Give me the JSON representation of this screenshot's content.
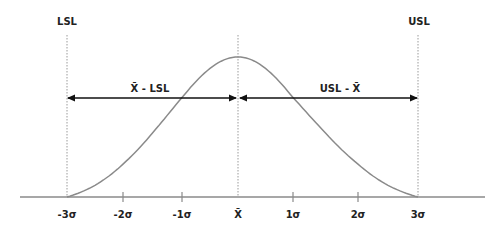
{
  "diagram": {
    "limits": {
      "lower": {
        "label": "LSL",
        "sigma": -3
      },
      "upper": {
        "label": "USL",
        "sigma": 3
      },
      "mean": {
        "label": "X̄",
        "sigma": 0
      }
    },
    "spans": {
      "left": {
        "label": "X̄ - LSL",
        "from_sigma": -3,
        "to_sigma": 0
      },
      "right": {
        "label": "USL - X̄",
        "from_sigma": 0,
        "to_sigma": 3
      }
    },
    "axis": {
      "ticks": [
        {
          "sigma": -3,
          "label": "-3σ"
        },
        {
          "sigma": -2,
          "label": "-2σ"
        },
        {
          "sigma": -1,
          "label": "-1σ"
        },
        {
          "sigma": 0,
          "label": "X̄"
        },
        {
          "sigma": 1,
          "label": "1σ"
        },
        {
          "sigma": 2,
          "label": "2σ"
        },
        {
          "sigma": 3,
          "label": "3σ"
        }
      ]
    },
    "colors": {
      "curve": "#8a8a8a",
      "axis": "#8a8a8a",
      "arrows": "#111111",
      "guides": "#9a9a9a",
      "text": "#222222"
    }
  }
}
